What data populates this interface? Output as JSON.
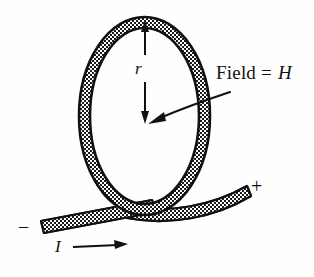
{
  "figure": {
    "background_color": "#fefefe",
    "ink_color": "#111111",
    "band_fill_pattern": "stipple-checkerboard",
    "labels": {
      "field_prefix": "Field = ",
      "field_symbol": "H",
      "radius": "r",
      "current": "I",
      "terminal_positive": "+",
      "terminal_negative": "−"
    },
    "elements": [
      {
        "name": "wire-loop",
        "kind": "ellipse-band",
        "description": "Vertical oval loop of wire drawn as a stippled band"
      },
      {
        "name": "lead-wire",
        "kind": "band",
        "description": "Straight lead wire entering from lower left"
      },
      {
        "name": "lead-wire-right",
        "kind": "curved-band",
        "description": "Curved lead wire exiting to upper right"
      },
      {
        "name": "radius-arrow",
        "kind": "double-arrow",
        "description": "Vertical double-headed arrow from loop top to loop center labeled r"
      },
      {
        "name": "field-arrow",
        "kind": "curved-arrow",
        "description": "Curved arrow from the Field = H label to the loop center"
      },
      {
        "name": "current-arrow",
        "kind": "arrow",
        "description": "Horizontal arrow along the lead wire indicating current direction"
      }
    ]
  }
}
